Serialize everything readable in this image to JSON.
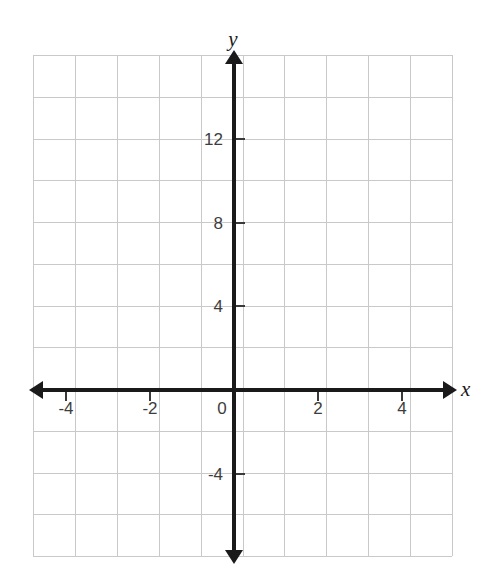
{
  "chart_data": {
    "type": "line",
    "title": "",
    "subtitle": "",
    "xlabel": "x",
    "ylabel": "y",
    "grid": true,
    "legend": null,
    "series": [],
    "data_points": [],
    "annotations": [],
    "xlim": [
      -5,
      5
    ],
    "ylim": [
      -6,
      12
    ],
    "x_tick_labels": [
      "-4",
      "-2",
      "0",
      "2",
      "4"
    ],
    "x_tick_values": [
      -4,
      -2,
      0,
      2,
      4
    ],
    "y_tick_labels": [
      "12",
      "8",
      "4",
      "-4"
    ],
    "y_tick_values": [
      12,
      8,
      4,
      -4
    ],
    "x_grid_step": 1,
    "y_grid_step": 2,
    "origin_label": "0"
  },
  "axes": {
    "y_name": "y",
    "x_name": "x"
  },
  "geometry": {
    "grid_left": 33,
    "grid_top": 55,
    "grid_width": 419,
    "grid_height": 501,
    "cols": 10,
    "rows": 12,
    "origin_x": 234,
    "origin_y": 390,
    "unit_px_x": 41.9,
    "unit_px_y": 20.9
  },
  "colors": {
    "background": "#ffffff",
    "grid_line": "#c9c9c9",
    "axis": "#1a1a1a",
    "tick_label": "#3d3d3d"
  }
}
